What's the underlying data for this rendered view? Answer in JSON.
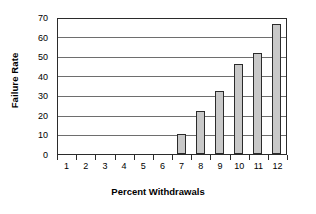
{
  "chart_data": {
    "type": "bar",
    "title": "",
    "subtitle": "",
    "xlabel": "Percent Withdrawals",
    "ylabel": "Failure Rate",
    "categories": [
      "1",
      "2",
      "3",
      "4",
      "5",
      "6",
      "7",
      "8",
      "9",
      "10",
      "11",
      "12"
    ],
    "values": [
      0,
      0,
      0,
      0,
      0,
      0,
      10,
      22,
      32,
      46,
      51.5,
      66.5
    ],
    "series": [
      {
        "name": "Failure Rate",
        "values": [
          0,
          0,
          0,
          0,
          0,
          0,
          10,
          22,
          32,
          46,
          51.5,
          66.5
        ]
      }
    ],
    "ylim": [
      0,
      70
    ],
    "ytick_labels": [
      "0",
      "10",
      "20",
      "30",
      "40",
      "50",
      "60",
      "70"
    ],
    "ytick_values": [
      0,
      10,
      20,
      30,
      40,
      50,
      60,
      70
    ],
    "grid": true,
    "grid_axis": "y",
    "legend": false,
    "legend_position": "none",
    "bar_fill_color": "#c8c8c8",
    "bar_border_color": "#2b2b2b",
    "gridline_color": "#6e6e6e",
    "axis_color": "#2b2b2b",
    "background_color": "#ffffff"
  }
}
